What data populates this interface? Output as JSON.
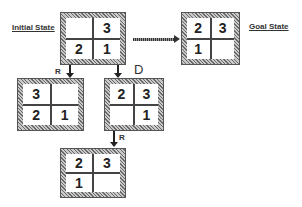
{
  "labels": {
    "initial": "Initial State",
    "goal": "Goal State"
  },
  "operators": {
    "initial_to_left": "R",
    "initial_to_right": "D",
    "right_to_bottom": "R"
  },
  "states": {
    "initial": {
      "cells": [
        "",
        "3",
        "2",
        "1"
      ]
    },
    "goal": {
      "cells": [
        "2",
        "3",
        "1",
        ""
      ]
    },
    "left": {
      "cells": [
        "3",
        "",
        "2",
        "1"
      ]
    },
    "right": {
      "cells": [
        "2",
        "3",
        "",
        "1"
      ]
    },
    "bottom": {
      "cells": [
        "2",
        "3",
        "1",
        ""
      ]
    }
  }
}
